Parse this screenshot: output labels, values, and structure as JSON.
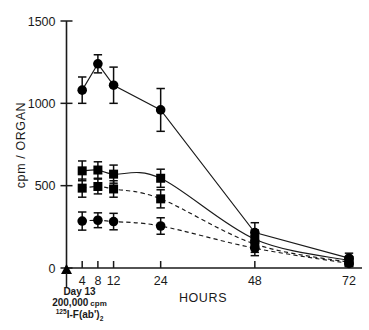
{
  "chart_data": {
    "type": "line",
    "title": "",
    "xlabel": "HOURS",
    "ylabel": "cpm / ORGAN",
    "xlim": [
      0,
      76
    ],
    "ylim": [
      0,
      1500
    ],
    "grid": false,
    "legend": "none",
    "x_tick_values": [
      0,
      4,
      8,
      12,
      24,
      48,
      72
    ],
    "x_tick_labels": [
      "",
      "4",
      "8",
      "12",
      "24",
      "48",
      "72"
    ],
    "y_tick_values": [
      0,
      500,
      1000,
      1500
    ],
    "y_tick_labels": [
      "0",
      "500",
      "1000",
      "1500"
    ],
    "annotations": [
      {
        "name": "injection-marker",
        "symbol": "triangle",
        "x": 0,
        "y": 0,
        "lines": [
          "Day 13",
          "200,000 cpm",
          "125 I-F(ab')2"
        ],
        "line1": "Day 13",
        "line2_number": "200,000",
        "line2_unit": "cpm",
        "line3_superscript": "125",
        "line3_main": "I-F(ab')",
        "line3_subscript": "2"
      }
    ],
    "series": [
      {
        "name": "series-1-circle-solid",
        "marker": "circle",
        "line": "solid",
        "x": [
          4,
          8,
          12,
          24,
          48,
          72
        ],
        "values": [
          1080,
          1240,
          1110,
          960,
          215,
          60
        ],
        "errors": [
          80,
          55,
          110,
          130,
          60,
          30
        ]
      },
      {
        "name": "series-2-square-solid",
        "marker": "square",
        "line": "solid",
        "x": [
          4,
          8,
          12,
          24,
          48,
          72
        ],
        "values": [
          590,
          595,
          570,
          545,
          175,
          45
        ],
        "errors": [
          60,
          50,
          55,
          55,
          55,
          25
        ]
      },
      {
        "name": "series-3-square-dashed",
        "marker": "square",
        "line": "dashed",
        "x": [
          4,
          8,
          12,
          24,
          48,
          72
        ],
        "values": [
          485,
          495,
          480,
          420,
          145,
          35
        ],
        "errors": [
          55,
          45,
          50,
          55,
          50,
          22
        ]
      },
      {
        "name": "series-4-circle-dashed",
        "marker": "circle",
        "line": "dashed",
        "x": [
          4,
          8,
          12,
          24,
          48,
          72
        ],
        "values": [
          285,
          290,
          282,
          255,
          120,
          28
        ],
        "errors": [
          55,
          45,
          50,
          50,
          45,
          20
        ]
      }
    ]
  }
}
